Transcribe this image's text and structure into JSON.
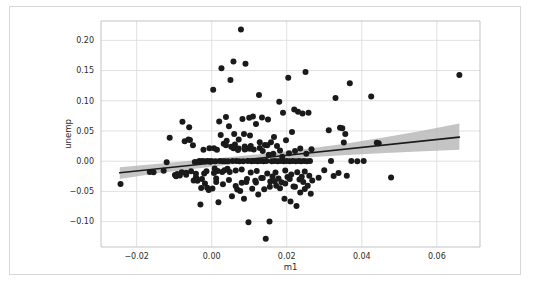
{
  "figure": {
    "background_color": "#ffffff",
    "frame_color": "#d7d7d7",
    "plot_background_color": "#ffffff",
    "grid_color": "#d9d9d9",
    "axis_color": "#bcbcbc"
  },
  "chart_data": {
    "type": "scatter",
    "title": "",
    "xlabel": "m1",
    "ylabel": "unemp",
    "xlim": [
      -0.0295,
      0.0715
    ],
    "ylim": [
      -0.142,
      0.232
    ],
    "xticks": [
      -0.02,
      0.0,
      0.02,
      0.04,
      0.06
    ],
    "xtick_labels": [
      "−0.02",
      "0.00",
      "0.02",
      "0.04",
      "0.06"
    ],
    "yticks": [
      -0.1,
      -0.05,
      0.0,
      0.05,
      0.1,
      0.15,
      0.2
    ],
    "ytick_labels": [
      "−0.10",
      "−0.05",
      "0.00",
      "0.05",
      "0.10",
      "0.15",
      "0.20"
    ],
    "grid": true,
    "legend": "none",
    "marker_color": "#1a1a1a",
    "marker_size": 3.0,
    "regression_line": {
      "color": "#1a1a1a",
      "width": 1.6,
      "x": [
        -0.0245,
        0.066
      ],
      "y": [
        -0.0192,
        0.0398
      ]
    },
    "confidence_band": {
      "color": "#b4b4b4",
      "opacity": 0.78,
      "x": [
        -0.0245,
        -0.015,
        -0.005,
        0.005,
        0.015,
        0.025,
        0.035,
        0.045,
        0.055,
        0.066
      ],
      "upper": [
        -0.01,
        -0.0045,
        0.0012,
        0.0068,
        0.0128,
        0.02,
        0.0285,
        0.0382,
        0.0492,
        0.0622
      ],
      "lower": [
        -0.0295,
        -0.0205,
        -0.0128,
        -0.0055,
        0.0012,
        0.0062,
        0.01,
        0.0132,
        0.0162,
        0.0188
      ]
    },
    "points": [
      [
        -0.0243,
        -0.0378
      ],
      [
        -0.0165,
        -0.0178
      ],
      [
        -0.0155,
        -0.0182
      ],
      [
        -0.0128,
        -0.016
      ],
      [
        -0.012,
        -0.0018
      ],
      [
        -0.0112,
        0.039
      ],
      [
        -0.0098,
        -0.0228
      ],
      [
        -0.0095,
        -0.025
      ],
      [
        -0.0092,
        -0.021
      ],
      [
        -0.0085,
        -0.0238
      ],
      [
        -0.008,
        -0.0182
      ],
      [
        -0.0078,
        0.0652
      ],
      [
        -0.0072,
        0.033
      ],
      [
        -0.0068,
        -0.019
      ],
      [
        -0.0062,
        0.0358
      ],
      [
        -0.006,
        0.0562
      ],
      [
        -0.0058,
        0.0352
      ],
      [
        -0.0055,
        -0.0165
      ],
      [
        -0.005,
        0.0262
      ],
      [
        -0.0048,
        -0.032
      ],
      [
        -0.0045,
        -0.0012
      ],
      [
        -0.0042,
        -0.0268
      ],
      [
        -0.004,
        -0.029
      ],
      [
        -0.0038,
        -0.0325
      ],
      [
        -0.0035,
        -0.0005
      ],
      [
        -0.0032,
        0.0002
      ],
      [
        -0.003,
        -0.0718
      ],
      [
        -0.0028,
        -0.0442
      ],
      [
        -0.0026,
        -0.0295
      ],
      [
        -0.0024,
        0.0002
      ],
      [
        -0.0022,
        0.0188
      ],
      [
        -0.002,
        -0.0205
      ],
      [
        -0.0018,
        -0.0368
      ],
      [
        -0.0016,
        0.0
      ],
      [
        -0.0014,
        -0.0168
      ],
      [
        -0.0012,
        -0.044
      ],
      [
        -0.001,
        0.0002
      ],
      [
        -0.0008,
        -0.0478
      ],
      [
        -0.0006,
        0.0215
      ],
      [
        -0.0004,
        -0.0008
      ],
      [
        -0.0002,
        0.0001
      ],
      [
        0.0,
        0.0
      ],
      [
        0.0002,
        -0.0452
      ],
      [
        0.0004,
        0.1182
      ],
      [
        0.0006,
        -0.0195
      ],
      [
        0.0008,
        -0.0122
      ],
      [
        0.001,
        0.0
      ],
      [
        0.0012,
        -0.0285
      ],
      [
        0.0014,
        0.019
      ],
      [
        0.0016,
        -0.0162
      ],
      [
        0.0018,
        -0.068
      ],
      [
        0.002,
        0.0655
      ],
      [
        0.0022,
        0.0002
      ],
      [
        0.0024,
        0.0432
      ],
      [
        0.0026,
        0.154
      ],
      [
        0.0028,
        -0.0178
      ],
      [
        0.003,
        0.0
      ],
      [
        0.0032,
        0.029
      ],
      [
        0.0034,
        -0.0148
      ],
      [
        0.0036,
        -0.0002
      ],
      [
        0.0038,
        0.073
      ],
      [
        0.004,
        0.034
      ],
      [
        0.0042,
        -0.0125
      ],
      [
        0.0044,
        0.0
      ],
      [
        0.0046,
        0.058
      ],
      [
        0.0048,
        -0.0178
      ],
      [
        0.005,
        0.1345
      ],
      [
        0.0052,
        0.024
      ],
      [
        0.0054,
        -0.058
      ],
      [
        0.0056,
        0.0002
      ],
      [
        0.0058,
        0.1648
      ],
      [
        0.006,
        0.0452
      ],
      [
        0.0062,
        0.0275
      ],
      [
        0.0064,
        -0.0152
      ],
      [
        0.0066,
        0.0002
      ],
      [
        0.0068,
        -0.0468
      ],
      [
        0.007,
        0.0185
      ],
      [
        0.0072,
        0.036
      ],
      [
        0.0074,
        0.0
      ],
      [
        0.0076,
        -0.0492
      ],
      [
        0.0078,
        0.218
      ],
      [
        0.008,
        -0.0138
      ],
      [
        0.0082,
        0.07
      ],
      [
        0.0084,
        0.0
      ],
      [
        0.0086,
        -0.062
      ],
      [
        0.0088,
        0.0245
      ],
      [
        0.009,
        0.1612
      ],
      [
        0.0092,
        -0.0345
      ],
      [
        0.0094,
        0.0208
      ],
      [
        0.0096,
        0.0002
      ],
      [
        0.0098,
        -0.101
      ],
      [
        0.01,
        0.0718
      ],
      [
        0.0102,
        0.0425
      ],
      [
        0.0104,
        -0.0188
      ],
      [
        0.0106,
        0.0
      ],
      [
        0.0108,
        -0.0455
      ],
      [
        0.011,
        0.074
      ],
      [
        0.0112,
        0.0192
      ],
      [
        0.0114,
        0.0002
      ],
      [
        0.0116,
        -0.0322
      ],
      [
        0.0118,
        0.0615
      ],
      [
        0.012,
        -0.0162
      ],
      [
        0.0122,
        0.0
      ],
      [
        0.0124,
        -0.0552
      ],
      [
        0.0126,
        0.1095
      ],
      [
        0.0128,
        0.0315
      ],
      [
        0.013,
        0.0002
      ],
      [
        0.0132,
        -0.0278
      ],
      [
        0.0134,
        0.0722
      ],
      [
        0.0136,
        0.0168
      ],
      [
        0.0138,
        0.0
      ],
      [
        0.014,
        -0.0465
      ],
      [
        0.0142,
        0.0268
      ],
      [
        0.0144,
        -0.1282
      ],
      [
        0.0146,
        0.0002
      ],
      [
        0.0148,
        -0.0205
      ],
      [
        0.015,
        0.0688
      ],
      [
        0.0152,
        0.0108
      ],
      [
        0.0154,
        -0.1
      ],
      [
        0.0156,
        -0.0335
      ],
      [
        0.0158,
        0.0312
      ],
      [
        0.016,
        0.0
      ],
      [
        0.0162,
        -0.0252
      ],
      [
        0.0164,
        0.0122
      ],
      [
        0.0166,
        0.0402
      ],
      [
        0.0168,
        0.0002
      ],
      [
        0.017,
        -0.0188
      ],
      [
        0.0172,
        -0.0408
      ],
      [
        0.0174,
        0.025
      ],
      [
        0.0176,
        0.0
      ],
      [
        0.0178,
        -0.0288
      ],
      [
        0.018,
        0.0985
      ],
      [
        0.0182,
        0.0178
      ],
      [
        0.0184,
        0.0002
      ],
      [
        0.0186,
        -0.0348
      ],
      [
        0.0188,
        0.0075
      ],
      [
        0.019,
        0.0802
      ],
      [
        0.0192,
        0.0
      ],
      [
        0.0194,
        -0.062
      ],
      [
        0.0196,
        -0.0155
      ],
      [
        0.0198,
        0.0345
      ],
      [
        0.02,
        0.0002
      ],
      [
        0.0202,
        -0.0262
      ],
      [
        0.0204,
        0.1382
      ],
      [
        0.0206,
        0.013
      ],
      [
        0.0208,
        0.0
      ],
      [
        0.021,
        -0.0665
      ],
      [
        0.0212,
        -0.022
      ],
      [
        0.0214,
        0.0482
      ],
      [
        0.0216,
        0.0002
      ],
      [
        0.0218,
        -0.0418
      ],
      [
        0.022,
        0.0855
      ],
      [
        0.0222,
        0.0168
      ],
      [
        0.0224,
        0.0
      ],
      [
        0.0226,
        -0.0742
      ],
      [
        0.0228,
        -0.0185
      ],
      [
        0.023,
        0.082
      ],
      [
        0.0232,
        0.0002
      ],
      [
        0.0234,
        -0.0302
      ],
      [
        0.0236,
        0.0212
      ],
      [
        0.0238,
        0.0
      ],
      [
        0.024,
        -0.0258
      ],
      [
        0.0242,
        0.079
      ],
      [
        0.0244,
        -0.0345
      ],
      [
        0.0246,
        0.0002
      ],
      [
        0.0248,
        -0.0172
      ],
      [
        0.025,
        0.1478
      ],
      [
        0.0252,
        0.0125
      ],
      [
        0.0254,
        0.0
      ],
      [
        0.0256,
        -0.0408
      ],
      [
        0.0258,
        0.08
      ],
      [
        0.026,
        -0.024
      ],
      [
        0.0262,
        0.0002
      ],
      [
        0.0264,
        -0.054
      ],
      [
        0.0266,
        0.0198
      ],
      [
        0.0268,
        -0.032
      ],
      [
        0.0285,
        -0.0275
      ],
      [
        0.03,
        -0.015
      ],
      [
        0.0312,
        0.051
      ],
      [
        0.0318,
        0.0002
      ],
      [
        0.0325,
        -0.0245
      ],
      [
        0.033,
        0.1045
      ],
      [
        0.0338,
        -0.0195
      ],
      [
        0.0342,
        0.0552
      ],
      [
        0.0348,
        0.0545
      ],
      [
        0.0352,
        0.031
      ],
      [
        0.0356,
        0.0452
      ],
      [
        0.036,
        -0.024
      ],
      [
        0.0368,
        0.1288
      ],
      [
        0.0372,
        0.0002
      ],
      [
        0.0388,
        0.0
      ],
      [
        0.0405,
        0.0002
      ],
      [
        0.0425,
        0.1072
      ],
      [
        0.044,
        0.0305
      ],
      [
        0.0445,
        0.0295
      ],
      [
        0.0478,
        -0.0268
      ],
      [
        0.066,
        0.1428
      ],
      [
        0.0094,
        -0.0295
      ],
      [
        0.0118,
        -0.0352
      ],
      [
        0.0136,
        -0.028
      ],
      [
        0.0155,
        -0.0425
      ],
      [
        0.0168,
        -0.0332
      ],
      [
        0.0182,
        -0.0448
      ],
      [
        0.0196,
        -0.0368
      ],
      [
        0.0208,
        -0.0295
      ],
      [
        0.0086,
        0.0452
      ],
      [
        0.0102,
        0.0205
      ],
      [
        0.0128,
        0.0218
      ],
      [
        0.0148,
        0.0262
      ],
      [
        -0.0068,
        -0.0225
      ],
      [
        -0.0042,
        -0.0208
      ],
      [
        0.0006,
        0.0215
      ],
      [
        0.0038,
        0.0265
      ],
      [
        0.0058,
        0.0215
      ],
      [
        0.0072,
        0.0208
      ],
      [
        0.0088,
        0.0195
      ],
      [
        0.0104,
        0.0252
      ],
      [
        0.0012,
        -0.0345
      ],
      [
        0.003,
        -0.0382
      ],
      [
        0.0046,
        -0.0312
      ],
      [
        0.0064,
        -0.0412
      ],
      [
        0.008,
        -0.0358
      ],
      [
        0.0222,
        -0.0425
      ],
      [
        0.0236,
        -0.052
      ],
      [
        0.0248,
        -0.0462
      ]
    ]
  }
}
